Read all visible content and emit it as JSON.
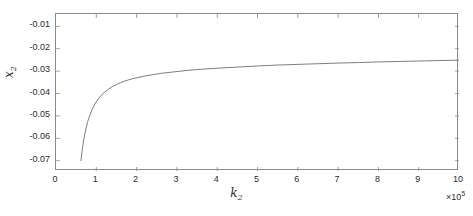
{
  "chart_data": {
    "type": "line",
    "title": "",
    "subtitle": "",
    "xlabel": "k_2",
    "xlabel_base": "k",
    "xlabel_sub": "2",
    "ylabel": "x_2",
    "ylabel_base": "x",
    "ylabel_sub": "2",
    "x_exponent_label": "×10",
    "x_exponent_power": "5",
    "x_exponent_multiplier": 100000,
    "xlim": [
      0,
      10
    ],
    "ylim": [
      -0.0746,
      -0.0045
    ],
    "xticks": [
      0,
      1,
      2,
      3,
      4,
      5,
      6,
      7,
      8,
      9,
      10
    ],
    "xtick_labels": [
      "0",
      "1",
      "2",
      "3",
      "4",
      "5",
      "6",
      "7",
      "8",
      "9",
      "10"
    ],
    "yticks": [
      -0.01,
      -0.02,
      -0.03,
      -0.04,
      -0.05,
      -0.06,
      -0.07
    ],
    "ytick_labels": [
      "-0.01",
      "-0.02",
      "-0.03",
      "-0.04",
      "-0.05",
      "-0.06",
      "-0.07"
    ],
    "grid": false,
    "legend": null,
    "legend_position": "none",
    "box": true,
    "tick_direction": "in",
    "line_color": "#6e6e6e",
    "axis_color": "#8a8a8a",
    "background_color": "#ffffff",
    "series": [
      {
        "name": "x2 vs k2",
        "color": "#6e6e6e",
        "x": [
          0.62,
          0.64,
          0.66,
          0.68,
          0.7,
          0.72,
          0.75,
          0.78,
          0.81,
          0.85,
          0.9,
          0.95,
          1.0,
          1.05,
          1.1,
          1.15,
          1.2,
          1.3,
          1.4,
          1.5,
          1.6,
          1.7,
          1.8,
          1.9,
          2.0,
          2.2,
          2.4,
          2.6,
          2.8,
          3.0,
          3.25,
          3.5,
          3.75,
          4.0,
          4.5,
          5.0,
          5.5,
          6.0,
          6.5,
          7.0,
          7.5,
          8.0,
          8.5,
          9.0,
          9.5,
          10.0
        ],
        "y": [
          -0.07,
          -0.0668,
          -0.064,
          -0.0616,
          -0.0595,
          -0.0576,
          -0.0551,
          -0.053,
          -0.0512,
          -0.0492,
          -0.047,
          -0.0452,
          -0.0437,
          -0.0424,
          -0.0413,
          -0.0403,
          -0.0395,
          -0.0381,
          -0.0369,
          -0.036,
          -0.0352,
          -0.0345,
          -0.0339,
          -0.0334,
          -0.033,
          -0.0322,
          -0.0316,
          -0.031,
          -0.0306,
          -0.0302,
          -0.0297,
          -0.0293,
          -0.029,
          -0.0287,
          -0.0282,
          -0.0277,
          -0.0273,
          -0.027,
          -0.0267,
          -0.0264,
          -0.0262,
          -0.0259,
          -0.0257,
          -0.0255,
          -0.0253,
          -0.0251
        ]
      }
    ]
  }
}
